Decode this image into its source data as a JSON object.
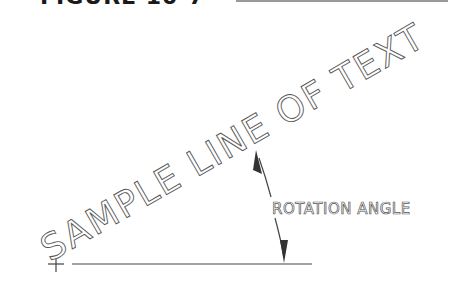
{
  "figure": {
    "heading": "FIGURE 10-7",
    "heading_clipped": true
  },
  "diagram": {
    "sample_text": "SAMPLE LINE OF TEXT",
    "sample_text_angle_deg": 30,
    "rotation_label": "ROTATION ANGLE",
    "insertion_marker": "+",
    "colors": {
      "stroke": "#444444",
      "text_outline": "#555555",
      "background": "#ffffff"
    }
  }
}
